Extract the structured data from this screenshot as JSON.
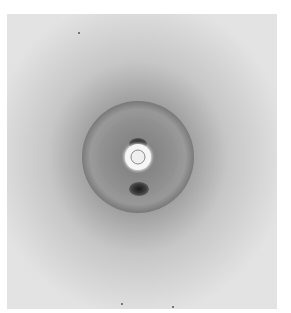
{
  "image": {
    "description": "X-ray fiber diffraction photograph",
    "background_color": "#e4e4e4",
    "center": {
      "x": 138,
      "y": 157
    },
    "features": [
      {
        "name": "central-beam-stop",
        "color": "#f6f6f6"
      },
      {
        "name": "inner-ring"
      },
      {
        "name": "meridional-spot-top"
      },
      {
        "name": "meridional-spot-bottom"
      },
      {
        "name": "diffuse-halo"
      }
    ]
  }
}
